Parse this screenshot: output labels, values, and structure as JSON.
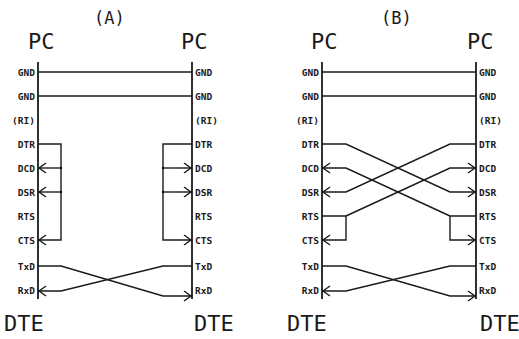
{
  "diagrams": [
    {
      "id": "A",
      "title": "(A)",
      "left_header": "PC",
      "right_header": "PC",
      "left_footer": "DTE",
      "right_footer": "DTE",
      "pins": [
        "GND",
        "GND",
        "(RI)",
        "DTR",
        "DCD",
        "DSR",
        "RTS",
        "CTS",
        "TxD",
        "RxD"
      ],
      "connections": [
        {
          "from": "GND",
          "to": "GND",
          "type": "straight"
        },
        {
          "from": "GND",
          "to": "GND",
          "type": "straight"
        },
        {
          "from": "DTR",
          "to": [
            "DCD",
            "DSR",
            "CTS"
          ],
          "type": "local-loopback",
          "side": "both"
        },
        {
          "from": "TxD",
          "to": "RxD",
          "type": "crossover"
        }
      ]
    },
    {
      "id": "B",
      "title": "(B)",
      "left_header": "PC",
      "right_header": "PC",
      "left_footer": "DTE",
      "right_footer": "DTE",
      "pins": [
        "GND",
        "GND",
        "(RI)",
        "DTR",
        "DCD",
        "DSR",
        "RTS",
        "CTS",
        "TxD",
        "RxD"
      ],
      "connections": [
        {
          "from": "GND",
          "to": "GND",
          "type": "straight"
        },
        {
          "from": "GND",
          "to": "GND",
          "type": "straight"
        },
        {
          "from": "DTR",
          "to": "DSR",
          "type": "crossover"
        },
        {
          "from": "RTS",
          "to": [
            "CTS",
            "DCD"
          ],
          "type": "loopback-and-crossover"
        },
        {
          "from": "TxD",
          "to": "RxD",
          "type": "crossover"
        }
      ]
    }
  ]
}
